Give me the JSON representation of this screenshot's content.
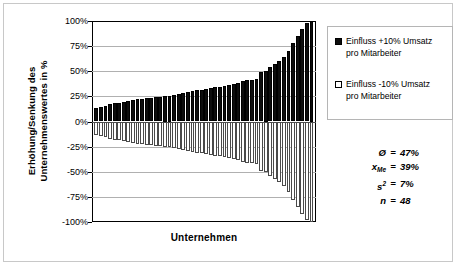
{
  "chart_data": {
    "type": "bar",
    "title": "",
    "xlabel": "Unternehmen",
    "ylabel": "Erhöhung/Senkung des Unternehmenswertes in %",
    "ylabel_line1": "Erhöhung/Senkung des",
    "ylabel_line2": "Unternehmenswertes in %",
    "ylim": [
      -100,
      100
    ],
    "yticks": [
      "100%",
      "75%",
      "50%",
      "25%",
      "0%",
      "-25%",
      "-50%",
      "-75%",
      "-100%"
    ],
    "ytick_values": [
      100,
      75,
      50,
      25,
      0,
      -25,
      -50,
      -75,
      -100
    ],
    "grid": true,
    "legend_position": "right",
    "n_categories": 48,
    "categories": [
      "1",
      "2",
      "3",
      "4",
      "5",
      "6",
      "7",
      "8",
      "9",
      "10",
      "11",
      "12",
      "13",
      "14",
      "15",
      "16",
      "17",
      "18",
      "19",
      "20",
      "21",
      "22",
      "23",
      "24",
      "25",
      "26",
      "27",
      "28",
      "29",
      "30",
      "31",
      "32",
      "33",
      "34",
      "35",
      "36",
      "37",
      "38",
      "39",
      "40",
      "41",
      "42",
      "43",
      "44",
      "45",
      "46",
      "47",
      "48"
    ],
    "series": [
      {
        "name": "Einfluss +10% Umsatz pro Mitarbeiter",
        "color": "#0d0d0d",
        "values": [
          13,
          14,
          15,
          17,
          18,
          18,
          19,
          20,
          21,
          22,
          22,
          23,
          23,
          24,
          24,
          25,
          25,
          26,
          27,
          28,
          29,
          30,
          31,
          31,
          32,
          33,
          34,
          34,
          35,
          36,
          37,
          38,
          40,
          41,
          41,
          42,
          49,
          50,
          54,
          57,
          60,
          64,
          70,
          78,
          85,
          92,
          98,
          100
        ]
      },
      {
        "name": "Einfluss -10% Umsatz pro Mitarbeiter",
        "color": "#ffffff",
        "values": [
          -13,
          -14,
          -15,
          -17,
          -18,
          -18,
          -19,
          -20,
          -21,
          -22,
          -22,
          -23,
          -23,
          -24,
          -24,
          -25,
          -25,
          -26,
          -27,
          -28,
          -29,
          -30,
          -31,
          -31,
          -32,
          -33,
          -34,
          -34,
          -35,
          -36,
          -37,
          -38,
          -40,
          -41,
          -41,
          -42,
          -49,
          -50,
          -54,
          -57,
          -60,
          -64,
          -70,
          -78,
          -85,
          -92,
          -98,
          -100
        ]
      }
    ]
  },
  "legend": {
    "items": [
      {
        "marker": "filled-square",
        "line1": "Einfluss +10% Umsatz",
        "line2": "pro Mitarbeiter"
      },
      {
        "marker": "hollow-square",
        "line1": "Einfluss -10% Umsatz",
        "line2": "pro Mitarbeiter"
      }
    ]
  },
  "stats": {
    "rows": [
      {
        "key": "Ø",
        "sub": "",
        "sup": "",
        "eq": "=",
        "value": "47%"
      },
      {
        "key": "x",
        "sub": "Me",
        "sup": "",
        "eq": "=",
        "value": "39%"
      },
      {
        "key": "s",
        "sub": "",
        "sup": "2",
        "eq": "=",
        "value": "7%"
      },
      {
        "key": "n",
        "sub": "",
        "sup": "",
        "eq": "=",
        "value": "48"
      }
    ]
  }
}
